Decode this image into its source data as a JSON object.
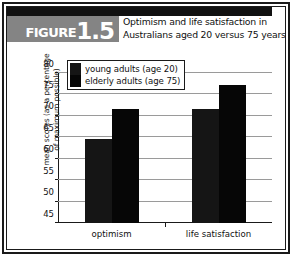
{
  "figure": {
    "badge_word": "FIGURE",
    "badge_number": "1.5",
    "title_line1": "Optimism and life satisfaction in",
    "title_line2": "Australians aged 20 versus 75 years"
  },
  "colors": {
    "series_young": "#151515",
    "series_elderly": "#060606",
    "badge_background": "#848484",
    "frame": "#1a1a1a",
    "gridline": "#9a9a9a"
  },
  "chart_data": {
    "type": "bar",
    "title": "Optimism and life satisfaction in Australians aged 20 versus 75 years",
    "categories": [
      "optimism",
      "life satisfaction"
    ],
    "series": [
      {
        "name": "young adults (age 20)",
        "values": [
          64.5,
          71.7
        ]
      },
      {
        "name": "elderly adults (age 75)",
        "values": [
          71.7,
          77.2
        ]
      }
    ],
    "xlabel": "",
    "ylabel": "mean scores (as a percentage of maximum possible)",
    "ylabel_line1": "mean scores (as a percentage",
    "ylabel_line2": "of maximum possible)",
    "ylim": [
      45,
      80
    ],
    "yticks": [
      45,
      50,
      55,
      60,
      65,
      70,
      75,
      80
    ],
    "ytick_labels": [
      "45",
      "50",
      "55",
      "60",
      "65",
      "70",
      "75",
      "80"
    ],
    "grid": true,
    "legend_position": "top-left-inside"
  },
  "legend": {
    "items": [
      {
        "label": "young adults (age 20)"
      },
      {
        "label": "elderly adults (age 75)"
      }
    ]
  }
}
